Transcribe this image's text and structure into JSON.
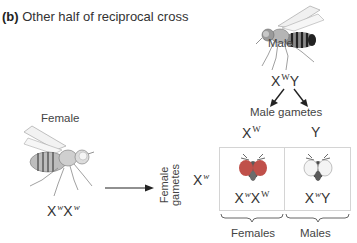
{
  "title": {
    "prefix": "(b)",
    "text": "Other half of reciprocal cross"
  },
  "male_parent": {
    "label": "Male",
    "genotype": {
      "base1": "X",
      "allele1": "W",
      "base2": "Y"
    },
    "icon": "fruit-fly-male"
  },
  "female_parent": {
    "label": "Female",
    "genotype": {
      "base1": "X",
      "allele1": "w",
      "base2": "X",
      "allele2": "w"
    },
    "icon": "fruit-fly-female"
  },
  "male_gametes": {
    "label": "Male gametes",
    "items": [
      {
        "base": "X",
        "allele": "W"
      },
      {
        "base": "Y",
        "allele": ""
      }
    ]
  },
  "female_gametes": {
    "label_line1": "Female",
    "label_line2": "gametes",
    "items": [
      {
        "base": "X",
        "allele": "w"
      }
    ]
  },
  "punnett": {
    "cells": [
      {
        "base1": "X",
        "allele1": "w",
        "base2": "X",
        "allele2": "W",
        "eye_color": "red",
        "eye_hex": "#c0504a"
      },
      {
        "base1": "X",
        "allele1": "w",
        "base2": "Y",
        "allele2": "",
        "eye_color": "white",
        "eye_hex": "#f4f4f4"
      }
    ]
  },
  "offspring_labels": {
    "females": "Females",
    "males": "Males"
  },
  "colors": {
    "text": "#333333",
    "box_border": "#d4d4d4",
    "red_eye": "#c0504a",
    "white_eye": "#f4f4f4"
  }
}
